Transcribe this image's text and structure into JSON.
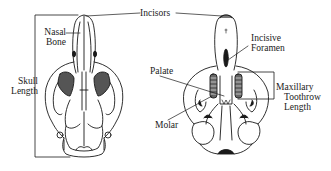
{
  "diagram": {
    "type": "anatomical-skull-diagram",
    "views": [
      "dorsal",
      "ventral"
    ],
    "stroke_color": "#1a1a1a",
    "background": "#ffffff"
  },
  "labels": {
    "incisors": "Incisors",
    "nasal_bone_line1": "Nasal",
    "nasal_bone_line2": "Bone",
    "skull_length_line1": "Skull",
    "skull_length_line2": "Length",
    "incisive_foramen_line1": "Incisive",
    "incisive_foramen_line2": "Foramen",
    "palate": "Palate",
    "molar": "Molar",
    "maxillary_line1": "Maxillary",
    "maxillary_line2": "Toothrow",
    "maxillary_line3": "Length"
  }
}
